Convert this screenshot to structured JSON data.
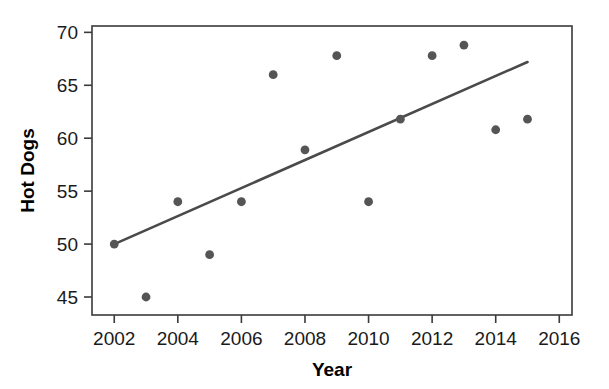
{
  "chart_data": {
    "type": "scatter",
    "title": "",
    "xlabel": "Year",
    "ylabel": "Hot Dogs",
    "xlim": [
      2001.3,
      2016.4
    ],
    "ylim": [
      43.3,
      70.6
    ],
    "grid": false,
    "legend": null,
    "xticks": [
      2002,
      2004,
      2006,
      2008,
      2010,
      2012,
      2014,
      2016
    ],
    "xtick_labels": [
      "2002",
      "2004",
      "2006",
      "2008",
      "2010",
      "2012",
      "2014",
      "2016"
    ],
    "yticks": [
      45,
      50,
      55,
      60,
      65,
      70
    ],
    "ytick_labels": [
      "45",
      "50",
      "55",
      "60",
      "65",
      "70"
    ],
    "x": [
      2002,
      2003,
      2004,
      2005,
      2006,
      2007,
      2008,
      2009,
      2010,
      2011,
      2012,
      2013,
      2014,
      2015
    ],
    "y": [
      50.0,
      45.0,
      54.0,
      49.0,
      54.0,
      66.0,
      58.9,
      67.8,
      54.0,
      61.8,
      67.8,
      68.8,
      60.8,
      61.8
    ],
    "series": [
      {
        "name": "Hot Dogs",
        "marker": "circle",
        "color": "#555555",
        "points": [
          {
            "x": 2002,
            "y": 50.0
          },
          {
            "x": 2003,
            "y": 45.0
          },
          {
            "x": 2004,
            "y": 54.0
          },
          {
            "x": 2005,
            "y": 49.0
          },
          {
            "x": 2006,
            "y": 54.0
          },
          {
            "x": 2007,
            "y": 66.0
          },
          {
            "x": 2008,
            "y": 58.9
          },
          {
            "x": 2009,
            "y": 67.8
          },
          {
            "x": 2010,
            "y": 54.0
          },
          {
            "x": 2011,
            "y": 61.8
          },
          {
            "x": 2012,
            "y": 67.8
          },
          {
            "x": 2013,
            "y": 68.8
          },
          {
            "x": 2014,
            "y": 60.8
          },
          {
            "x": 2015,
            "y": 61.8
          }
        ]
      }
    ],
    "trend_line": {
      "name": "regression-line",
      "color": "#4a4a4a",
      "x_start": 2002,
      "y_start": 50.0,
      "x_end": 2015,
      "y_end": 67.2
    },
    "colors": {
      "marker": "#555555",
      "trend": "#4a4a4a",
      "axis": "#3a3a3a",
      "text": "#1a1a1a",
      "background": "#ffffff"
    }
  }
}
